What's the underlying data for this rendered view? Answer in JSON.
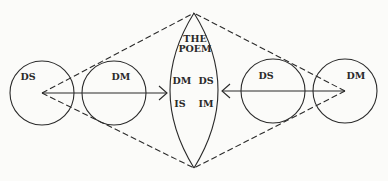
{
  "diagram": {
    "colors": {
      "stroke": "#2a2a2a",
      "background": "#fbfbf9"
    },
    "left_group": {
      "outer_circle_label": "DS",
      "inner_circle_label": "DM",
      "arrow_direction": "right"
    },
    "center_lens": {
      "title_line1": "THE",
      "title_line2": "POEM",
      "cells": {
        "top_left": "DM",
        "top_right": "DS",
        "bottom_left": "IS",
        "bottom_right": "IM"
      }
    },
    "right_group": {
      "inner_circle_label": "DS",
      "outer_circle_label": "DM",
      "arrow_direction": "left"
    },
    "edges": [
      {
        "from": "left-ds-center",
        "to": "lens-top",
        "style": "dashed"
      },
      {
        "from": "left-ds-center",
        "to": "lens-bottom",
        "style": "dashed"
      },
      {
        "from": "right-dm-center",
        "to": "lens-top",
        "style": "dashed"
      },
      {
        "from": "right-dm-center",
        "to": "lens-bottom",
        "style": "dashed"
      },
      {
        "from": "left-ds-center",
        "to": "lens-left",
        "style": "solid-arrow"
      },
      {
        "from": "right-dm-center",
        "to": "lens-right",
        "style": "solid-arrow"
      }
    ]
  }
}
